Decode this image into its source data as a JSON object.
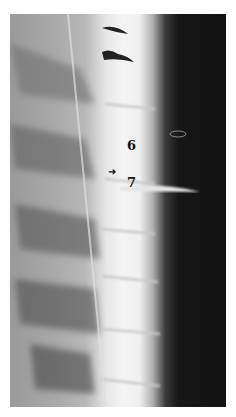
{
  "image": {
    "type": "radiograph",
    "description": "Lateral thoracic spine X-ray with needle projection between vertebrae",
    "labels": {
      "vertebra_upper": "6",
      "vertebra_lower": "7"
    },
    "marker": {
      "glyph": "➜",
      "semantic": "arrow-pointer"
    },
    "colors": {
      "bone": "#f2f2f2",
      "soft_tissue": "#a0a0a0",
      "background_dark": "#141414",
      "border": "#ffffff"
    }
  }
}
